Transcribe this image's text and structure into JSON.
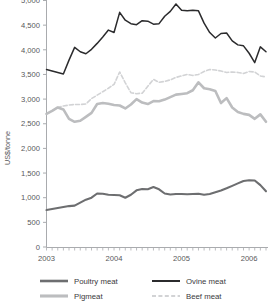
{
  "chart_data": {
    "type": "line",
    "title": "",
    "subtitle": "",
    "xlabel": "",
    "ylabel": "US$/tonne",
    "ylim": [
      0,
      5000
    ],
    "ytick_values": [
      0,
      500,
      1000,
      1500,
      2000,
      2500,
      3000,
      3500,
      4000,
      4500,
      5000
    ],
    "ytick_labels": [
      "0",
      "500",
      "1,000",
      "1,500",
      "2,000",
      "2,500",
      "3,000",
      "3,500",
      "4,000",
      "4,500",
      "5,000"
    ],
    "xlim": [
      0,
      39
    ],
    "xtick_labels": [
      "2003",
      "2004",
      "2005",
      "2006"
    ],
    "xtick_positions": [
      0,
      12,
      24,
      36
    ],
    "x_minor_ticks": 40,
    "grid": false,
    "legend_position": "bottom",
    "series": [
      {
        "name": "Poultry meat",
        "color": "#6d6e70",
        "style": "solid",
        "width": 2.1,
        "values": [
          750,
          770,
          790,
          810,
          830,
          840,
          900,
          960,
          1000,
          1085,
          1080,
          1060,
          1055,
          1050,
          1000,
          1060,
          1150,
          1175,
          1170,
          1215,
          1170,
          1085,
          1065,
          1075,
          1075,
          1070,
          1075,
          1080,
          1060,
          1075,
          1110,
          1145,
          1190,
          1240,
          1290,
          1340,
          1355,
          1350,
          1255,
          1130
        ]
      },
      {
        "name": "Pigmeat",
        "color": "#bcbdbf",
        "style": "solid",
        "width": 2.6,
        "values": [
          2700,
          2760,
          2830,
          2790,
          2600,
          2540,
          2560,
          2640,
          2720,
          2900,
          2920,
          2905,
          2880,
          2870,
          2810,
          2890,
          3000,
          2930,
          2900,
          2960,
          2955,
          2990,
          3040,
          3090,
          3105,
          3120,
          3180,
          3340,
          3220,
          3200,
          3165,
          2920,
          3020,
          2830,
          2740,
          2700,
          2680,
          2600,
          2690,
          2540
        ]
      },
      {
        "name": "Ovine meat",
        "color": "#2b2b2d",
        "style": "solid",
        "width": 1.5,
        "values": [
          3600,
          3570,
          3540,
          3510,
          3790,
          4050,
          3960,
          3920,
          4010,
          4130,
          4260,
          4400,
          4350,
          4760,
          4600,
          4530,
          4510,
          4590,
          4580,
          4520,
          4530,
          4680,
          4780,
          4930,
          4800,
          4790,
          4800,
          4790,
          4540,
          4350,
          4240,
          4330,
          4340,
          4180,
          4100,
          4080,
          3930,
          3740,
          4060,
          3960
        ]
      },
      {
        "name": "Beef meat",
        "color": "#d2d3d5",
        "style": "dashed",
        "width": 1.6,
        "values": [
          2700,
          2760,
          2830,
          2860,
          2880,
          2890,
          2890,
          2900,
          3010,
          3080,
          3150,
          3220,
          3300,
          3550,
          3330,
          3130,
          3110,
          3120,
          3260,
          3400,
          3340,
          3360,
          3390,
          3440,
          3470,
          3500,
          3480,
          3500,
          3560,
          3600,
          3590,
          3570,
          3540,
          3550,
          3540,
          3520,
          3560,
          3550,
          3470,
          3450
        ]
      }
    ]
  },
  "legend": {
    "entries": [
      {
        "label": "Poultry meat"
      },
      {
        "label": "Ovine meat"
      },
      {
        "label": "Pigmeat"
      },
      {
        "label": "Beef meat"
      }
    ]
  }
}
